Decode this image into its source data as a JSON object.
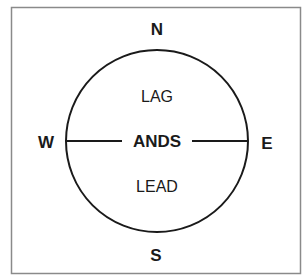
{
  "diagram": {
    "directions": {
      "north": "N",
      "south": "S",
      "west": "W",
      "east": "E"
    },
    "regions": {
      "upper": "LAG",
      "lower": "LEAD"
    },
    "center_label": "ANDS",
    "colors": {
      "stroke": "#1a1a1a",
      "frame": "#8a8a8a",
      "background": "#ffffff"
    }
  }
}
